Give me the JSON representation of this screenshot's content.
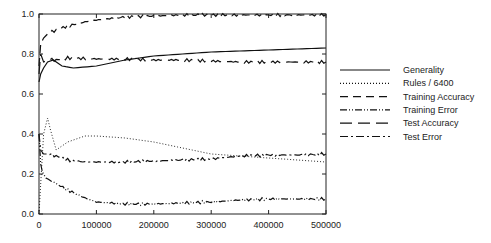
{
  "chart_data": {
    "type": "line",
    "title": "",
    "xlabel": "",
    "ylabel": "",
    "xlim": [
      0,
      500000
    ],
    "ylim": [
      0.0,
      1.0
    ],
    "grid": false,
    "legend_position": "right",
    "x_ticks": [
      0,
      100000,
      200000,
      300000,
      400000,
      500000
    ],
    "x_tick_labels": [
      "0",
      "100000",
      "200000",
      "300000",
      "400000",
      "500000"
    ],
    "y_ticks": [
      0.0,
      0.2,
      0.4,
      0.6,
      0.8,
      1.0
    ],
    "y_tick_labels": [
      "0.0",
      "0.2",
      "0.4",
      "0.6",
      "0.8",
      "1.0"
    ],
    "series": [
      {
        "name": "Generality",
        "style": "solid",
        "x": [
          0,
          3000,
          8000,
          15000,
          25000,
          40000,
          60000,
          100000,
          150000,
          200000,
          250000,
          300000,
          350000,
          400000,
          450000,
          500000
        ],
        "values": [
          0.66,
          0.7,
          0.73,
          0.76,
          0.77,
          0.74,
          0.73,
          0.74,
          0.77,
          0.79,
          0.8,
          0.81,
          0.815,
          0.82,
          0.825,
          0.83
        ]
      },
      {
        "name": "Rules / 6400",
        "style": "dotted",
        "x": [
          0,
          3000,
          8000,
          15000,
          20000,
          30000,
          50000,
          80000,
          100000,
          150000,
          200000,
          250000,
          300000,
          350000,
          400000,
          450000,
          500000
        ],
        "values": [
          0.0,
          0.15,
          0.4,
          0.48,
          0.42,
          0.32,
          0.36,
          0.39,
          0.39,
          0.38,
          0.36,
          0.33,
          0.3,
          0.29,
          0.28,
          0.27,
          0.26
        ]
      },
      {
        "name": "Training Accuracy",
        "style": "dashed",
        "x": [
          0,
          3000,
          8000,
          15000,
          30000,
          50000,
          80000,
          100000,
          150000,
          200000,
          250000,
          300000,
          400000,
          500000
        ],
        "values": [
          0.74,
          0.85,
          0.88,
          0.9,
          0.92,
          0.94,
          0.96,
          0.97,
          0.985,
          0.99,
          0.995,
          0.995,
          0.995,
          0.995
        ]
      },
      {
        "name": "Training Error",
        "style": "dash-dot-dot",
        "x": [
          0,
          3000,
          6000,
          12000,
          25000,
          50000,
          80000,
          100000,
          150000,
          200000,
          250000,
          300000,
          350000,
          400000,
          450000,
          500000
        ],
        "values": [
          0.4,
          0.25,
          0.21,
          0.18,
          0.16,
          0.12,
          0.08,
          0.06,
          0.05,
          0.05,
          0.055,
          0.06,
          0.07,
          0.075,
          0.075,
          0.075
        ]
      },
      {
        "name": "Test Accuracy",
        "style": "long-dash",
        "x": [
          0,
          3000,
          8000,
          15000,
          30000,
          50000,
          100000,
          150000,
          200000,
          250000,
          300000,
          350000,
          400000,
          450000,
          500000
        ],
        "values": [
          0.7,
          0.8,
          0.76,
          0.77,
          0.77,
          0.78,
          0.775,
          0.775,
          0.77,
          0.77,
          0.765,
          0.76,
          0.76,
          0.76,
          0.76
        ]
      },
      {
        "name": "Test Error",
        "style": "dash-dot",
        "x": [
          0,
          3000,
          8000,
          15000,
          30000,
          50000,
          80000,
          100000,
          150000,
          200000,
          250000,
          300000,
          350000,
          400000,
          450000,
          500000
        ],
        "values": [
          0.4,
          0.32,
          0.3,
          0.3,
          0.29,
          0.27,
          0.26,
          0.26,
          0.26,
          0.265,
          0.27,
          0.275,
          0.29,
          0.295,
          0.295,
          0.3
        ]
      }
    ]
  },
  "legend": {
    "items": [
      {
        "label": "Generality",
        "dash": ""
      },
      {
        "label": "Rules / 6400",
        "dash": "1,2"
      },
      {
        "label": "Training Accuracy",
        "dash": "8,5"
      },
      {
        "label": "Training Error",
        "dash": "7,2,1,2,1,2"
      },
      {
        "label": "Test Accuracy",
        "dash": "12,6"
      },
      {
        "label": "Test Error",
        "dash": "8,3,2,3"
      }
    ]
  }
}
